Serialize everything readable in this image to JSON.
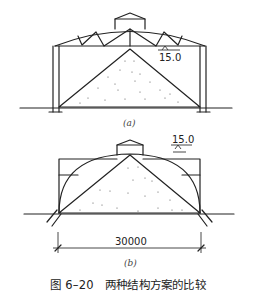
{
  "figure": {
    "caption": "图 6–20　两种结构方案的比较",
    "panels": [
      {
        "id": "a",
        "label": "(a)",
        "elevation_label": "15.0",
        "description": "Truss roof on columns over triangular sand pile with roof monitor"
      },
      {
        "id": "b",
        "label": "(b)",
        "elevation_label": "15.0",
        "span_dimension": "30000",
        "description": "Arch structure springing from ground over triangular sand pile with roof monitor"
      }
    ]
  },
  "colors": {
    "line": "#222222",
    "background": "#ffffff"
  }
}
